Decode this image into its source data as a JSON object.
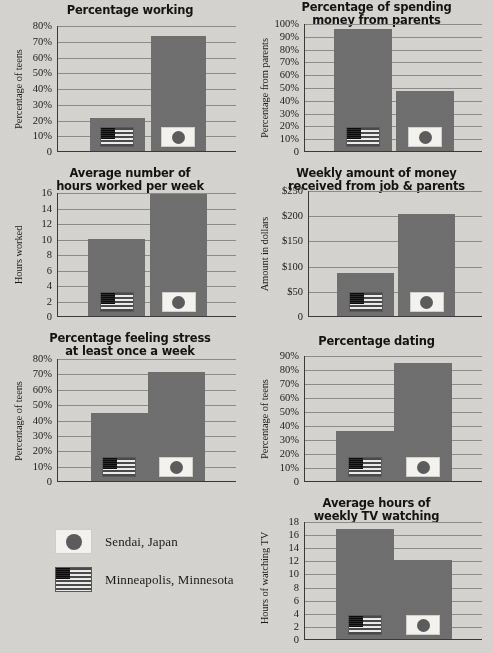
{
  "page": {
    "background_color": "#d5d4d0",
    "bar_color": "#6f6f6f",
    "gridline_color": "#8d8c88",
    "axis_color": "#3a3a3a"
  },
  "legend": {
    "items": [
      {
        "label": "Sendai, Japan",
        "flag": "japan-flag-icon",
        "series": "Japan"
      },
      {
        "label": "Minneapolis, Minnesota",
        "flag": "us-flag-icon",
        "series": "USA"
      }
    ]
  },
  "chart_data": [
    {
      "id": "percentage-working",
      "type": "bar",
      "title": "Percentage working",
      "title_lines": [
        "Percentage working"
      ],
      "ylabel": "Percentage of teens",
      "xlabel": "",
      "categories": [
        "Minneapolis, Minnesota",
        "Sendai, Japan"
      ],
      "values": [
        21,
        73
      ],
      "ylim": [
        0,
        80
      ],
      "ytick_labels": [
        "80%",
        "70%",
        "60%",
        "50%",
        "40%",
        "30%",
        "20%",
        "10%",
        "0"
      ],
      "ytick_values": [
        80,
        70,
        60,
        50,
        40,
        30,
        20,
        10,
        0
      ],
      "grid": true,
      "legend_position": "external"
    },
    {
      "id": "spending-money-from-parents",
      "type": "bar",
      "title": "Percentage of spending money from parents",
      "title_lines": [
        "Percentage of spending",
        "money from parents"
      ],
      "ylabel": "Percentage from parents",
      "xlabel": "",
      "categories": [
        "Minneapolis, Minnesota",
        "Sendai, Japan"
      ],
      "values": [
        95,
        47
      ],
      "ylim": [
        0,
        100
      ],
      "ytick_labels": [
        "100%",
        "90%",
        "80%",
        "70%",
        "60%",
        "50%",
        "40%",
        "30%",
        "20%",
        "10%",
        "0"
      ],
      "ytick_values": [
        100,
        90,
        80,
        70,
        60,
        50,
        40,
        30,
        20,
        10,
        0
      ],
      "grid": true,
      "legend_position": "external"
    },
    {
      "id": "hours-worked-per-week",
      "type": "bar",
      "title": "Average number of hours worked per week",
      "title_lines": [
        "Average number of",
        "hours worked per week"
      ],
      "ylabel": "Hours worked",
      "xlabel": "",
      "categories": [
        "Minneapolis, Minnesota",
        "Sendai, Japan"
      ],
      "values": [
        9.9,
        15.7
      ],
      "ylim": [
        0,
        16
      ],
      "ytick_labels": [
        "16",
        "14",
        "12",
        "10",
        "8",
        "6",
        "4",
        "2",
        "0"
      ],
      "ytick_values": [
        16,
        14,
        12,
        10,
        8,
        6,
        4,
        2,
        0
      ],
      "grid": true,
      "legend_position": "external"
    },
    {
      "id": "weekly-money-received",
      "type": "bar",
      "title": "Weekly amount of money received from job & parents",
      "title_lines": [
        "Weekly amount of money",
        "received from job & parents"
      ],
      "ylabel": "Amount in dollars",
      "xlabel": "",
      "categories": [
        "Minneapolis, Minnesota",
        "Sendai, Japan"
      ],
      "values": [
        85,
        203
      ],
      "ylim": [
        0,
        250
      ],
      "ytick_labels": [
        "$250",
        "$200",
        "$150",
        "$100",
        "$50",
        "0"
      ],
      "ytick_values": [
        250,
        200,
        150,
        100,
        50,
        0
      ],
      "grid": true,
      "legend_position": "external"
    },
    {
      "id": "feeling-stress",
      "type": "bar",
      "title": "Percentage feeling stress at least once a week",
      "title_lines": [
        "Percentage feeling stress",
        "at least once a week"
      ],
      "ylabel": "Percentage of teens",
      "xlabel": "",
      "categories": [
        "Minneapolis, Minnesota",
        "Sendai, Japan"
      ],
      "values": [
        44,
        71
      ],
      "ylim": [
        0,
        80
      ],
      "ytick_labels": [
        "80%",
        "70%",
        "60%",
        "50%",
        "40%",
        "30%",
        "20%",
        "10%",
        "0"
      ],
      "ytick_values": [
        80,
        70,
        60,
        50,
        40,
        30,
        20,
        10,
        0
      ],
      "grid": true,
      "legend_position": "external"
    },
    {
      "id": "percentage-dating",
      "type": "bar",
      "title": "Percentage dating",
      "title_lines": [
        "Percentage dating"
      ],
      "ylabel": "Percentage of teens",
      "xlabel": "",
      "categories": [
        "Minneapolis, Minnesota",
        "Sendai, Japan"
      ],
      "values": [
        36,
        84
      ],
      "ylim": [
        0,
        90
      ],
      "ytick_labels": [
        "90%",
        "80%",
        "70%",
        "60%",
        "50%",
        "40%",
        "30%",
        "20%",
        "10%",
        "0"
      ],
      "ytick_values": [
        90,
        80,
        70,
        60,
        50,
        40,
        30,
        20,
        10,
        0
      ],
      "grid": true,
      "legend_position": "external"
    },
    {
      "id": "weekly-tv-watching",
      "type": "bar",
      "title": "Average hours of weekly TV watching",
      "title_lines": [
        "Average hours of",
        "weekly TV watching"
      ],
      "ylabel": "Hours of watching TV",
      "xlabel": "",
      "categories": [
        "Minneapolis, Minnesota",
        "Sendai, Japan"
      ],
      "values": [
        16.8,
        12
      ],
      "ylim": [
        0,
        18
      ],
      "ytick_labels": [
        "18",
        "16",
        "14",
        "12",
        "10",
        "8",
        "6",
        "4",
        "2",
        "0"
      ],
      "ytick_values": [
        18,
        16,
        14,
        12,
        10,
        8,
        6,
        4,
        2,
        0
      ],
      "grid": true,
      "legend_position": "external"
    }
  ]
}
